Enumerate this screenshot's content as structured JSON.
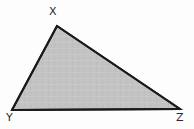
{
  "figure": {
    "kind": "geometry-diagram",
    "shape": "triangle",
    "background_color": "#fdfdfd",
    "fill_color": "#c3c3c3",
    "stroke_color": "#1a1a1a",
    "stroke_width": 2,
    "label_color": "#2b2b2b",
    "label_font_size": 11,
    "vertices": [
      {
        "id": "x",
        "label": "X",
        "x": 57,
        "y": 26,
        "label_x": 49,
        "label_y": 6
      },
      {
        "id": "y",
        "label": "Y",
        "x": 12,
        "y": 110,
        "label_x": 6,
        "label_y": 112
      },
      {
        "id": "z",
        "label": "Z",
        "x": 180,
        "y": 109,
        "label_x": 176,
        "label_y": 112
      }
    ],
    "polygon_points": "57,26 180,109 12,110",
    "edges": [
      {
        "id": "xy",
        "from": "X",
        "to": "Y"
      },
      {
        "id": "yz",
        "from": "Y",
        "to": "Z"
      },
      {
        "id": "zx",
        "from": "Z",
        "to": "X"
      }
    ]
  }
}
